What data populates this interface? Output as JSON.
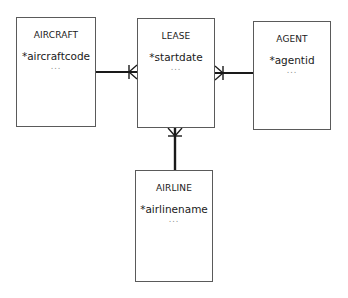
{
  "diagram": {
    "type": "entity-relationship",
    "notation": "crows-foot",
    "entities": [
      {
        "id": "aircraft",
        "name": "AIRCRAFT",
        "key_attribute": "*aircraftcode",
        "more": "..."
      },
      {
        "id": "lease",
        "name": "LEASE",
        "key_attribute": "*startdate",
        "more": "..."
      },
      {
        "id": "agent",
        "name": "AGENT",
        "key_attribute": "*agentid",
        "more": "..."
      },
      {
        "id": "airline",
        "name": "AIRLINE",
        "key_attribute": "*airlinename",
        "more": "..."
      }
    ],
    "relationships": [
      {
        "from": "AIRCRAFT",
        "to": "LEASE",
        "from_cardinality": "one",
        "to_cardinality": "many"
      },
      {
        "from": "AGENT",
        "to": "LEASE",
        "from_cardinality": "one",
        "to_cardinality": "many"
      },
      {
        "from": "AIRLINE",
        "to": "LEASE",
        "from_cardinality": "one",
        "to_cardinality": "many"
      }
    ],
    "colors": {
      "box_border": "#5a5a5a",
      "connector": "#1a1a1a",
      "text": "#1a1a1a",
      "ellipsis": "#8a8a8a"
    }
  }
}
